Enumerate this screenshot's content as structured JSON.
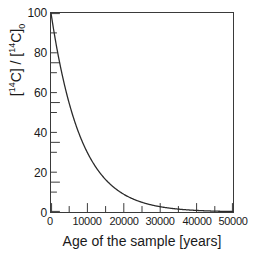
{
  "chart_data": {
    "type": "line",
    "title": "",
    "xlabel": "Age of the sample [years]",
    "ylabel_parts": {
      "open": "[",
      "mass": "14",
      "element": "C] / [",
      "mass2": "14",
      "element2": "C]",
      "subscript": "0"
    },
    "ylabel_plain": "[14C] / [14C]0",
    "xlim": [
      0,
      50000
    ],
    "ylim": [
      0,
      100
    ],
    "xticks": [
      0,
      10000,
      20000,
      30000,
      40000,
      50000
    ],
    "xtick_labels": [
      "0",
      "10000",
      "20000",
      "30000",
      "40000",
      "50000"
    ],
    "xminor_step": 5000,
    "yticks": [
      0,
      20,
      40,
      60,
      80,
      100
    ],
    "ytick_labels": [
      "0",
      "20",
      "40",
      "60",
      "80",
      "100"
    ],
    "yminor_step": 10,
    "grid": false,
    "legend": null,
    "line_color": "#2b2b2b",
    "frame_color": "#3a3a3a",
    "background": "#ffffff",
    "half_life_years": 5730,
    "series": [
      {
        "name": "Carbon-14 decay",
        "x": [
          0,
          1000,
          2000,
          3000,
          4000,
          5000,
          5730,
          6000,
          7000,
          8000,
          9000,
          10000,
          11460,
          12000,
          14000,
          16000,
          17190,
          18000,
          20000,
          22000,
          22920,
          24000,
          26000,
          28000,
          28650,
          30000,
          32000,
          34000,
          34380,
          36000,
          38000,
          40000,
          40110,
          42000,
          44000,
          45840,
          46000,
          48000,
          50000
        ],
        "y": [
          100.0,
          88.6,
          78.5,
          69.6,
          61.6,
          54.6,
          50.0,
          48.4,
          42.9,
          38.0,
          33.6,
          29.8,
          25.0,
          23.5,
          18.5,
          14.6,
          12.5,
          11.5,
          9.06,
          7.14,
          6.25,
          5.29,
          4.17,
          3.28,
          3.13,
          2.58,
          2.04,
          1.6,
          1.56,
          1.27,
          1.0,
          0.79,
          0.78,
          0.62,
          0.49,
          0.39,
          0.39,
          0.3,
          0.24
        ]
      }
    ]
  }
}
